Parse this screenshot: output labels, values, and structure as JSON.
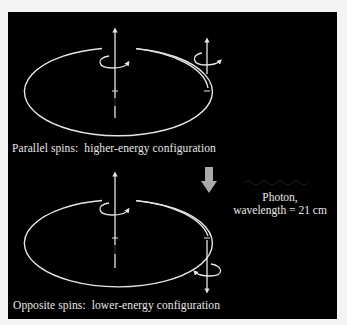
{
  "diagram": {
    "colors": {
      "background": "#000000",
      "frame": "#f4f4f4",
      "line": "#e6e6e6",
      "photon_arrow": "#aaaaaa",
      "text": "#e8e8e8"
    },
    "top_configuration": {
      "caption": "Parallel spins:  higher-energy configuration",
      "proton_spin": "up",
      "electron_spin": "up"
    },
    "bottom_configuration": {
      "caption": "Opposite spins:  lower-energy configuration",
      "proton_spin": "up",
      "electron_spin": "down"
    },
    "transition": {
      "arrow_icon": "down-arrow-icon",
      "photon_label_line1": "Photon,",
      "photon_label_line2": "wavelength = 21 cm"
    }
  }
}
